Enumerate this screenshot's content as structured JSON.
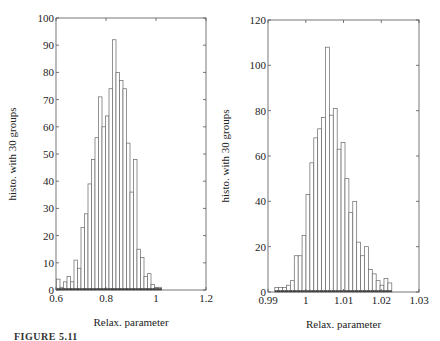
{
  "caption": "FIGURE 5.11",
  "chart_data": [
    {
      "type": "bar",
      "title": "",
      "xlabel": "Relax. parameter",
      "ylabel": "histo. with 30 groups",
      "xlim": [
        0.6,
        1.2
      ],
      "ylim": [
        0,
        100
      ],
      "xticks": [
        "0.6",
        "0.8",
        "1",
        "1.2"
      ],
      "yticks": [
        "0",
        "10",
        "20",
        "30",
        "40",
        "50",
        "60",
        "70",
        "80",
        "90",
        "100"
      ],
      "bin_start": 0.602,
      "bin_width": 0.014,
      "values": [
        4,
        1,
        3,
        5,
        3,
        11,
        8,
        23,
        28,
        39,
        48,
        56,
        71,
        60,
        64,
        74,
        92,
        80,
        77,
        74,
        54,
        36,
        48,
        15,
        12,
        5,
        6,
        2,
        1,
        1
      ],
      "grid": false
    },
    {
      "type": "bar",
      "title": "",
      "xlabel": "Relax. parameter",
      "ylabel": "histo. with 30 groups",
      "xlim": [
        0.99,
        1.03
      ],
      "ylim": [
        0,
        120
      ],
      "xticks": [
        "0.99",
        "1",
        "1.01",
        "1.02",
        "1.03"
      ],
      "yticks": [
        "0",
        "20",
        "40",
        "60",
        "80",
        "100",
        "120"
      ],
      "bin_start": 0.9918,
      "bin_width": 0.001033,
      "values": [
        2,
        2,
        2,
        3,
        5,
        16,
        16,
        25,
        43,
        57,
        68,
        72,
        77,
        108,
        78,
        81,
        63,
        66,
        50,
        35,
        40,
        22,
        16,
        20,
        10,
        8,
        5,
        3,
        6,
        4
      ],
      "grid": false
    }
  ]
}
